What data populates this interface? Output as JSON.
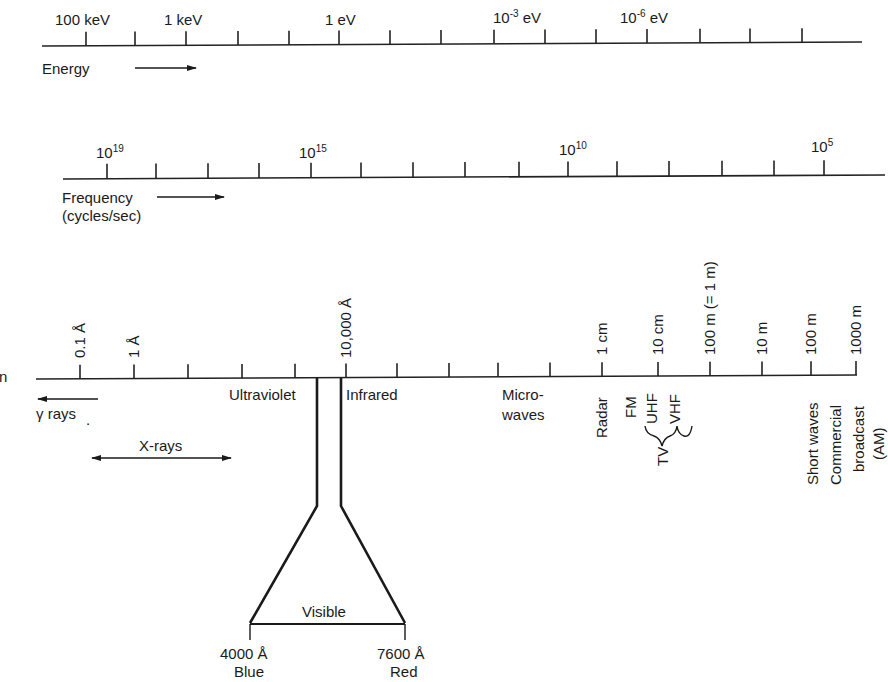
{
  "energy_axis": {
    "title": "Energy",
    "ticks_x": [
      86,
      135,
      186,
      238,
      289,
      339,
      390,
      441,
      494,
      545,
      596,
      647,
      700,
      750,
      802
    ],
    "labels": [
      {
        "text": "100 keV",
        "x": 86
      },
      {
        "base": "1 keV",
        "x": 186
      },
      {
        "base": "1 eV",
        "x": 339
      },
      {
        "base": "10",
        "sup": "-3",
        "unit": " eV",
        "x": 494
      },
      {
        "base": "10",
        "sup": "-6",
        "unit": " eV",
        "x": 647
      }
    ]
  },
  "frequency_axis": {
    "title_line1": "Frequency",
    "title_line2": "(cycles/sec)",
    "ticks_x": [
      107,
      156,
      208,
      259,
      311,
      361,
      413,
      465,
      519,
      568,
      617,
      669,
      722,
      774,
      824
    ],
    "labels": [
      {
        "base": "10",
        "sup": "19",
        "x": 107
      },
      {
        "base": "10",
        "sup": "15",
        "x": 311
      },
      {
        "base": "10",
        "sup": "10",
        "x": 568
      },
      {
        "base": "10",
        "sup": "5",
        "x": 824
      }
    ]
  },
  "wavelength_axis": {
    "title_fragment": "n",
    "ticks_x": [
      80,
      134,
      188,
      242,
      295,
      346,
      397,
      449,
      498,
      550,
      602,
      658,
      710,
      762,
      811,
      856
    ],
    "tick_labels": [
      {
        "text": "0.1 Å",
        "x": 80
      },
      {
        "text": "1 Å",
        "x": 134
      },
      {
        "text": "10,000 Å",
        "x": 346
      },
      {
        "text": "1 cm",
        "x": 602
      },
      {
        "text": "10 cm",
        "x": 658
      },
      {
        "text": "100 m (= 1 m)",
        "x": 710
      },
      {
        "text": "10 m",
        "x": 762
      },
      {
        "text": "100 m",
        "x": 811
      },
      {
        "text": "1000 m",
        "x": 856
      }
    ]
  },
  "regions": {
    "gamma": "γ rays",
    "xrays": "X-rays",
    "ultraviolet": "Ultraviolet",
    "infrared": "Infrared",
    "microwaves_line1": "Micro-",
    "microwaves_line2": "waves",
    "radar": "Radar",
    "fm": "FM",
    "tv": "TV",
    "uhf": "UHF",
    "vhf": "VHF",
    "short_waves": "Short waves",
    "commercial_line1": "Commercial",
    "commercial_line2": "broadcast",
    "commercial_line3": "(AM)"
  },
  "visible": {
    "label": "Visible",
    "blue_wavelength": "4000 Å",
    "blue_name": "Blue",
    "red_wavelength": "7600 Å",
    "red_name": "Red"
  }
}
